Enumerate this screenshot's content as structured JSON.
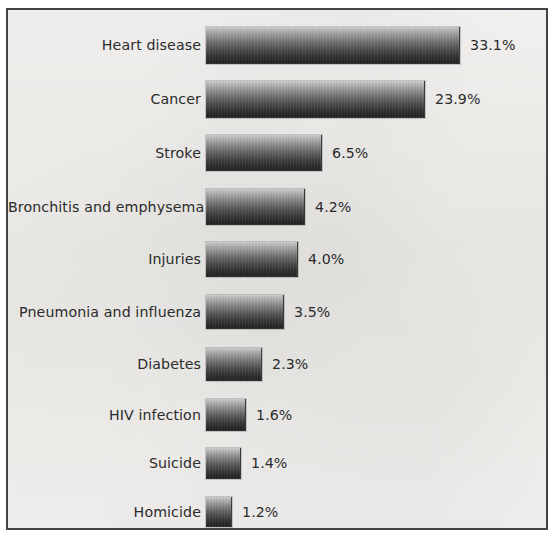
{
  "figure": {
    "background_color": "#f1f0ee",
    "frame_color": "#41454a",
    "text_color": "#2b2b2b",
    "bar_top_color": "#cfcfcf",
    "bar_bottom_color": "#232323"
  },
  "chart_data": {
    "type": "bar",
    "orientation": "horizontal",
    "title": "",
    "subtitle": "",
    "xlabel": "",
    "ylabel": "",
    "grid": false,
    "legend": null,
    "axis_visible": false,
    "value_suffix": "%",
    "categories": [
      "Heart disease",
      "Cancer",
      "Stroke",
      "Bronchitis and emphysema",
      "Injuries",
      "Pneumonia and influenza",
      "Diabetes",
      "HIV infection",
      "Suicide",
      "Homicide"
    ],
    "values": [
      33.1,
      23.9,
      6.5,
      4.2,
      4.0,
      3.5,
      2.3,
      1.6,
      1.4,
      1.2
    ],
    "value_labels": [
      "33.1%",
      "23.9%",
      "6.5%",
      "4.2%",
      "4.0%",
      "3.5%",
      "2.3%",
      "1.6%",
      "1.4%",
      "1.2%"
    ],
    "xlim": [
      0,
      35
    ],
    "bars": [
      {
        "label": "Heart disease",
        "value": 33.1,
        "value_label": "33.1%",
        "bar_width_px": 254,
        "row_top_px": 17,
        "bar_height_px": 37
      },
      {
        "label": "Cancer",
        "value": 23.9,
        "value_label": "23.9%",
        "bar_width_px": 219,
        "row_top_px": 71,
        "bar_height_px": 37
      },
      {
        "label": "Stroke",
        "value": 6.5,
        "value_label": "6.5%",
        "bar_width_px": 116,
        "row_top_px": 125,
        "bar_height_px": 36
      },
      {
        "label": "Bronchitis and emphysema",
        "value": 4.2,
        "value_label": "4.2%",
        "bar_width_px": 99,
        "row_top_px": 179,
        "bar_height_px": 36
      },
      {
        "label": "Injuries",
        "value": 4.0,
        "value_label": "4.0%",
        "bar_width_px": 92,
        "row_top_px": 232,
        "bar_height_px": 35
      },
      {
        "label": "Pneumonia and influenza",
        "value": 3.5,
        "value_label": "3.5%",
        "bar_width_px": 78,
        "row_top_px": 285,
        "bar_height_px": 34
      },
      {
        "label": "Diabetes",
        "value": 2.3,
        "value_label": "2.3%",
        "bar_width_px": 56,
        "row_top_px": 338,
        "bar_height_px": 33
      },
      {
        "label": "HIV infection",
        "value": 1.6,
        "value_label": "1.6%",
        "bar_width_px": 40,
        "row_top_px": 389,
        "bar_height_px": 32
      },
      {
        "label": "Suicide",
        "value": 1.4,
        "value_label": "1.4%",
        "bar_width_px": 35,
        "row_top_px": 438,
        "bar_height_px": 31
      },
      {
        "label": "Homicide",
        "value": 1.2,
        "value_label": "1.2%",
        "bar_width_px": 26,
        "row_top_px": 487,
        "bar_height_px": 30
      }
    ],
    "layout": {
      "label_column_right_px": 193,
      "bar_start_x_px": 198,
      "value_gap_px": 10
    }
  }
}
